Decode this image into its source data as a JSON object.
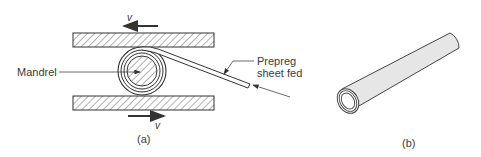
{
  "figure_a": {
    "caption": "(a)",
    "labels": {
      "mandrel": "Mandrel",
      "prepreg_line1": "Prepreg",
      "prepreg_line2": "sheet fed",
      "velocity_top": "v",
      "velocity_bottom": "v"
    },
    "components": [
      "top-plate",
      "bottom-plate",
      "mandrel",
      "wound-prepreg-layers",
      "prepreg-sheet"
    ],
    "motion": {
      "top_plate_direction": "left",
      "bottom_plate_direction": "right"
    }
  },
  "figure_b": {
    "caption": "(b)",
    "description": "rolled tube"
  },
  "colors": {
    "line": "#333333",
    "hatch": "#555555",
    "tube_fill": "#e6e6e6"
  }
}
